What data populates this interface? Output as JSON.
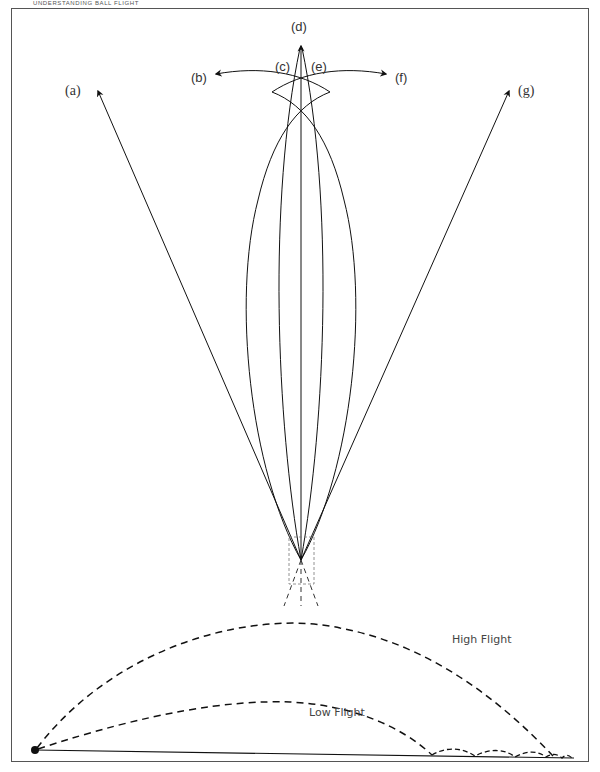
{
  "header": {
    "running_head": "UNDERSTANDING BALL FLIGHT"
  },
  "diagram": {
    "paths": [
      {
        "id": "a",
        "label": "(a)",
        "type": "straight",
        "description": "pull (straight left)"
      },
      {
        "id": "b",
        "label": "(b)",
        "type": "curved",
        "description": "hook curving left"
      },
      {
        "id": "c",
        "label": "(c)",
        "type": "curved",
        "description": "slight draw"
      },
      {
        "id": "d",
        "label": "(d)",
        "type": "straight",
        "description": "straight"
      },
      {
        "id": "e",
        "label": "(e)",
        "type": "curved",
        "description": "slight fade"
      },
      {
        "id": "f",
        "label": "(f)",
        "type": "curved",
        "description": "slice curving right"
      },
      {
        "id": "g",
        "label": "(g)",
        "type": "straight",
        "description": "push (straight right)"
      }
    ],
    "trajectories": [
      {
        "id": "high",
        "label": "High Flight",
        "style": "dashed"
      },
      {
        "id": "low",
        "label": "Low Flight",
        "style": "dashed",
        "note": "bounces along ground"
      }
    ]
  },
  "colors": {
    "line": "#111111",
    "text": "#333333",
    "frame": "#555555"
  }
}
